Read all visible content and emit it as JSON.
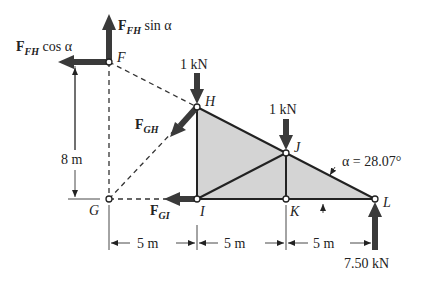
{
  "diagram": {
    "type": "truss free-body diagram",
    "nodes": {
      "F": {
        "label": "F",
        "x": 109,
        "y": 62
      },
      "H": {
        "label": "H",
        "x": 197,
        "y": 107
      },
      "G": {
        "label": "G",
        "x": 109,
        "y": 199
      },
      "I": {
        "label": "I",
        "x": 197,
        "y": 199
      },
      "J": {
        "label": "J",
        "x": 286,
        "y": 153
      },
      "K": {
        "label": "K",
        "x": 286,
        "y": 199
      },
      "L": {
        "label": "L",
        "x": 375,
        "y": 199
      }
    },
    "forces": {
      "ffh_sin": {
        "main": "F",
        "sub": "FH",
        "suffix": " sin α"
      },
      "ffh_cos": {
        "main": "F",
        "sub": "FH",
        "suffix": " cos α"
      },
      "fgh": {
        "main": "F",
        "sub": "GH"
      },
      "fgi": {
        "main": "F",
        "sub": "GI"
      },
      "load_h": "1 kN",
      "load_j": "1 kN",
      "reaction_l": "7.50 kN"
    },
    "angle_label": "α = 28.07°",
    "dimensions": {
      "height": "8 m",
      "spans": [
        "5 m",
        "5 m",
        "5 m"
      ]
    },
    "colors": {
      "shade": "#d4d4d4",
      "member": "#222222",
      "arrow": "#3a3a3a"
    }
  }
}
